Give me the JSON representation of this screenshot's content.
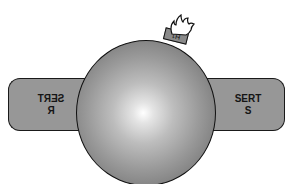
{
  "figure": {
    "caption": "",
    "object": "bomb-sphere",
    "fuse_cap_label": "H1",
    "left_panel": {
      "line1": "SERT",
      "line2": "R",
      "mirrored": true
    },
    "right_panel": {
      "line1": "SERT",
      "line2": "S",
      "mirrored": false
    }
  },
  "colors": {
    "panel_fill": "#979797",
    "outline": "#1a1a1a",
    "sphere_highlight": "#ffffff",
    "sphere_shadow": "#6a6a6a",
    "background": "#ffffff"
  }
}
